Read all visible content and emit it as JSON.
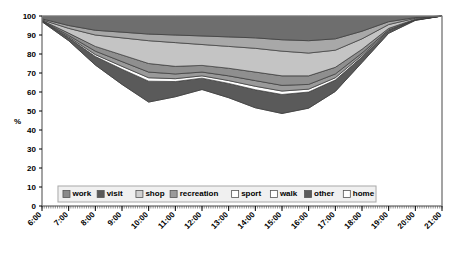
{
  "chart_data": {
    "type": "area",
    "title": "",
    "subtitle": "",
    "xlabel": "",
    "ylabel": "%",
    "ylim": [
      0,
      100
    ],
    "yticks": [
      0,
      10,
      20,
      30,
      40,
      50,
      60,
      70,
      80,
      90,
      100
    ],
    "grid": false,
    "stacked": true,
    "stack_total": 100,
    "legend_position": "inside-bottom-center",
    "x": [
      "6:00",
      "7:00",
      "8:00",
      "9:00",
      "10:00",
      "11:00",
      "12:00",
      "13:00",
      "14:00",
      "15:00",
      "16:00",
      "17:00",
      "18:00",
      "19:00",
      "20:00",
      "21:00"
    ],
    "xticks": [
      "6:00",
      "7:00",
      "8:00",
      "9:00",
      "10:00",
      "11:00",
      "12:00",
      "13:00",
      "14:00",
      "15:00",
      "16:00",
      "17:00",
      "18:00",
      "19:00",
      "20:00",
      "21:00"
    ],
    "series": [
      {
        "name": "work",
        "color": "#6e6e6e",
        "values": [
          1.5,
          5.0,
          7.5,
          8.5,
          9.5,
          10.0,
          10.5,
          11.0,
          11.5,
          12.5,
          13.0,
          12.0,
          8.0,
          3.0,
          0.8,
          0.0
        ]
      },
      {
        "name": "visit",
        "color": "#a8a8a8",
        "values": [
          0.5,
          1.5,
          2.5,
          3.0,
          3.5,
          4.0,
          4.5,
          5.0,
          5.5,
          6.0,
          6.5,
          6.0,
          4.0,
          1.5,
          0.4,
          0.0
        ]
      },
      {
        "name": "shop",
        "color": "#c4c4c4",
        "values": [
          0.3,
          2.5,
          6.0,
          9.0,
          12.0,
          12.5,
          11.0,
          11.5,
          12.5,
          13.0,
          12.0,
          9.0,
          5.5,
          2.0,
          0.5,
          0.0
        ]
      },
      {
        "name": "recreation",
        "color": "#8f8f8f",
        "values": [
          0.2,
          1.2,
          2.5,
          3.5,
          4.5,
          4.0,
          3.5,
          4.0,
          4.5,
          5.0,
          4.5,
          3.5,
          2.0,
          0.8,
          0.2,
          0.0
        ]
      },
      {
        "name": "sport",
        "color": "#9a9a9a",
        "values": [
          0.2,
          0.8,
          1.8,
          2.5,
          3.0,
          2.5,
          2.0,
          2.5,
          3.0,
          3.0,
          2.5,
          2.0,
          1.2,
          0.5,
          0.1,
          0.0
        ]
      },
      {
        "name": "walk",
        "color": "#ffffff",
        "values": [
          0.1,
          0.5,
          1.0,
          1.5,
          1.8,
          1.5,
          1.2,
          1.5,
          1.8,
          1.8,
          1.5,
          1.2,
          0.8,
          0.3,
          0.1,
          0.0
        ]
      },
      {
        "name": "other",
        "color": "#5a5a5a",
        "values": [
          0.2,
          1.5,
          4.5,
          8.0,
          11.0,
          8.0,
          6.0,
          7.5,
          9.5,
          10.0,
          8.5,
          6.0,
          3.0,
          1.0,
          0.2,
          0.0
        ]
      },
      {
        "name": "home",
        "color": "#ffffff",
        "values": [
          97.0,
          87.0,
          74.2,
          64.0,
          54.7,
          57.5,
          61.3,
          57.0,
          51.7,
          48.7,
          51.5,
          60.3,
          75.5,
          90.9,
          97.7,
          100.0
        ]
      }
    ],
    "stack_order_top_to_bottom": [
      "work",
      "visit",
      "shop",
      "recreation",
      "sport",
      "walk",
      "other",
      "home"
    ],
    "top_boundary_values": [
      100,
      100,
      100,
      100,
      100,
      100,
      100,
      100,
      100,
      100,
      100,
      100,
      100,
      100,
      100,
      100
    ]
  },
  "legend": {
    "items": [
      {
        "label": "work",
        "color": "#8a8a8a"
      },
      {
        "label": "visit",
        "color": "#595959"
      },
      {
        "label": "shop",
        "color": "#d0d0d0"
      },
      {
        "label": "recreation",
        "color": "#9b9b9b"
      },
      {
        "label": "sport",
        "color": "#ffffff"
      },
      {
        "label": "walk",
        "color": "#ffffff"
      },
      {
        "label": "other",
        "color": "#5a5a5a"
      },
      {
        "label": "home",
        "color": "#ffffff"
      }
    ]
  },
  "axes": {
    "y_label": "%",
    "y_ticks": [
      "100",
      "90",
      "80",
      "70",
      "60",
      "50",
      "40",
      "30",
      "20",
      "10",
      "0"
    ],
    "x_ticks": [
      "6:00",
      "7:00",
      "8:00",
      "9:00",
      "10:00",
      "11:00",
      "12:00",
      "13:00",
      "14:00",
      "15:00",
      "16:00",
      "17:00",
      "18:00",
      "19:00",
      "20:00",
      "21:00"
    ]
  }
}
